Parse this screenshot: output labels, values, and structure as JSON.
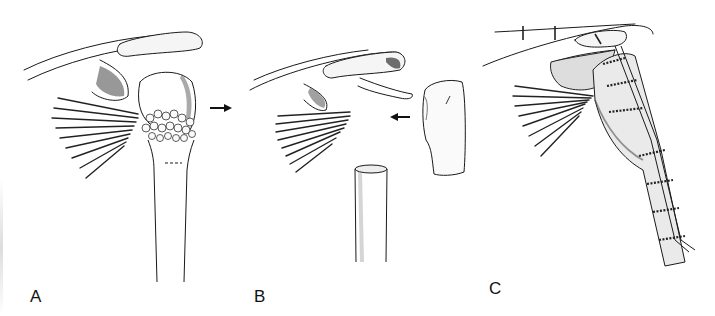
{
  "figure": {
    "panels": [
      {
        "label": "A",
        "description": "Shoulder with proximal humerus tumor (nodular mass at metaphysis), arrow pointing right"
      },
      {
        "label": "B",
        "description": "Resected proximal humerus segment separated from shaft, arrow pointing left toward glenoid"
      },
      {
        "label": "C",
        "description": "Reconstruction with allograft/implant fixed by strut and circumferential cerclage wires"
      }
    ],
    "colors": {
      "ink": "#1a1a1a",
      "shade": "#555555",
      "background": "#ffffff"
    }
  }
}
